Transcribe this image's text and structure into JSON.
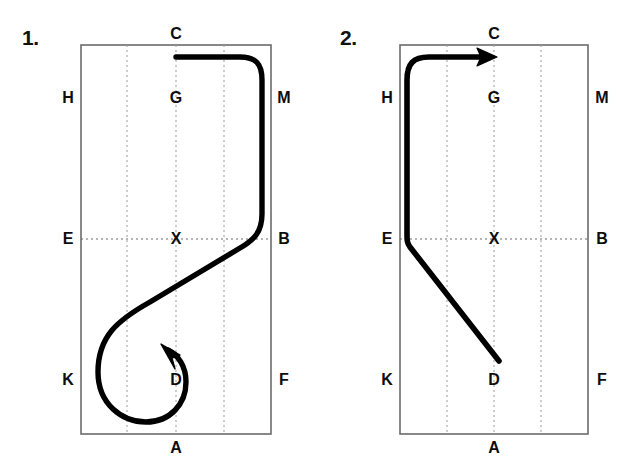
{
  "page": {
    "background_color": "#ffffff",
    "width": 636,
    "height": 472,
    "stroke_color": "#000000",
    "arena_border_color": "#6b6b6b",
    "centerline_color": "#9a9a9a"
  },
  "diagrams": [
    {
      "number_label": "1.",
      "arena": {
        "left": 81,
        "top": 45,
        "right": 271,
        "bottom": 434,
        "vertical_dotted_lines_x": [
          127,
          176,
          224
        ],
        "horizontal_dotted_line_y": 239
      },
      "markers": [
        {
          "name": "C",
          "label": "C",
          "x": 176,
          "y": 34,
          "align": "center"
        },
        {
          "name": "H",
          "label": "H",
          "x": 68,
          "y": 98,
          "align": "center"
        },
        {
          "name": "G",
          "label": "G",
          "x": 176,
          "y": 98,
          "align": "center"
        },
        {
          "name": "M",
          "label": "M",
          "x": 284,
          "y": 98,
          "align": "center"
        },
        {
          "name": "E",
          "label": "E",
          "x": 68,
          "y": 239,
          "align": "center"
        },
        {
          "name": "X",
          "label": "X",
          "x": 176,
          "y": 239,
          "align": "center"
        },
        {
          "name": "B",
          "label": "B",
          "x": 284,
          "y": 239,
          "align": "center"
        },
        {
          "name": "K",
          "label": "K",
          "x": 68,
          "y": 380,
          "align": "center"
        },
        {
          "name": "D",
          "label": "D",
          "x": 176,
          "y": 380,
          "align": "center"
        },
        {
          "name": "F",
          "label": "F",
          "x": 284,
          "y": 380,
          "align": "center"
        },
        {
          "name": "A",
          "label": "A",
          "x": 176,
          "y": 448,
          "align": "center"
        }
      ],
      "path_description": "Line starts at C on the centre line heading right toward M, rounds the corner onto the right track, travels down the long side to B, curves off onto a long diagonal toward K, then makes a small circle at D finishing with an arrowhead pointing up and left.",
      "arrow_direction": "up-left",
      "arrow_tip": {
        "x": 168,
        "y": 349
      }
    },
    {
      "number_label": "2.",
      "arena": {
        "left": 400,
        "top": 45,
        "right": 588,
        "bottom": 434,
        "vertical_dotted_lines_x": [
          447,
          494,
          541
        ],
        "horizontal_dotted_line_y": 239
      },
      "markers": [
        {
          "name": "C",
          "label": "C",
          "x": 494,
          "y": 34,
          "align": "center"
        },
        {
          "name": "H",
          "label": "H",
          "x": 387,
          "y": 98,
          "align": "center"
        },
        {
          "name": "G",
          "label": "G",
          "x": 494,
          "y": 98,
          "align": "center"
        },
        {
          "name": "M",
          "label": "M",
          "x": 602,
          "y": 98,
          "align": "center"
        },
        {
          "name": "E",
          "label": "E",
          "x": 387,
          "y": 239,
          "align": "center"
        },
        {
          "name": "X",
          "label": "X",
          "x": 494,
          "y": 239,
          "align": "center"
        },
        {
          "name": "B",
          "label": "B",
          "x": 602,
          "y": 239,
          "align": "center"
        },
        {
          "name": "K",
          "label": "K",
          "x": 387,
          "y": 380,
          "align": "center"
        },
        {
          "name": "D",
          "label": "D",
          "x": 494,
          "y": 380,
          "align": "center"
        },
        {
          "name": "F",
          "label": "F",
          "x": 602,
          "y": 380,
          "align": "center"
        },
        {
          "name": "A",
          "label": "A",
          "x": 494,
          "y": 448,
          "align": "center"
        }
      ],
      "path_description": "Line starts on a diagonal below E heading up and left to E, turns up the left long side to H, rounds the corner and runs along the short side finishing with an arrowhead pointing right at C.",
      "arrow_direction": "right",
      "arrow_tip": {
        "x": 496,
        "y": 60
      }
    }
  ]
}
